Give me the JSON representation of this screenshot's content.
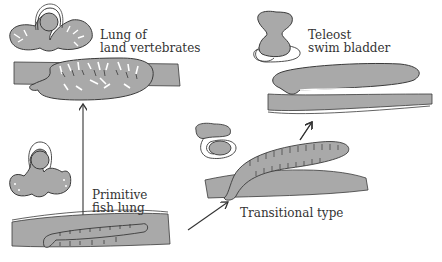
{
  "colors": {
    "tissue": "#a9a9a9",
    "outline": "#3a3a3a",
    "background": "#ffffff",
    "text": "#333333"
  },
  "stages": [
    {
      "id": "lung",
      "label_line1": "Lung of",
      "label_line2": "land vertebrates"
    },
    {
      "id": "primitive",
      "label_line1": "Primitive",
      "label_line2": "fish lung"
    },
    {
      "id": "transitional",
      "label_line1": "Transitional type"
    },
    {
      "id": "teleost",
      "label_line1": "Teleost",
      "label_line2": "swim bladder"
    }
  ],
  "arrows": [
    {
      "from": "primitive",
      "to": "lung"
    },
    {
      "from": "primitive",
      "to": "transitional"
    },
    {
      "from": "transitional",
      "to": "teleost"
    }
  ]
}
